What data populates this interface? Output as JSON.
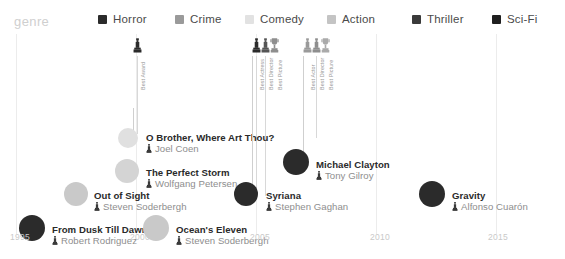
{
  "legend": {
    "title": "genre",
    "items": [
      {
        "label": "Horror",
        "color": "#2b2b2b",
        "x": 98
      },
      {
        "label": "Crime",
        "color": "#9a9a9a",
        "x": 175
      },
      {
        "label": "Comedy",
        "color": "#e2e2e2",
        "x": 245
      },
      {
        "label": "Action",
        "color": "#c4c4c4",
        "x": 327
      },
      {
        "label": "Thriller",
        "color": "#3a3a3a",
        "x": 412
      },
      {
        "label": "Sci-Fi",
        "color": "#1f1f1f",
        "x": 492
      }
    ]
  },
  "axis": {
    "ticks": [
      {
        "label": "1995",
        "x": 10
      },
      {
        "label": "2000",
        "x": 130
      },
      {
        "label": "2005",
        "x": 250
      },
      {
        "label": "2010",
        "x": 370
      },
      {
        "label": "2015",
        "x": 488
      }
    ],
    "gridlines_x": [
      16,
      136,
      256,
      376,
      496
    ]
  },
  "awards": [
    {
      "name": "award-marker-1",
      "label": "Best Award",
      "icon": "oscar-statuette-icon",
      "color": "#2b2b2b",
      "x": 133,
      "icon_y": 4,
      "text_y": 56,
      "stem_y": 22,
      "stem_h": 78
    },
    {
      "name": "award-marker-2",
      "label": "Best Actress",
      "icon": "oscar-statuette-icon",
      "color": "#2b2b2b",
      "x": 252,
      "icon_y": 4,
      "text_y": 56,
      "stem_y": 22,
      "stem_h": 140
    },
    {
      "name": "award-marker-3",
      "label": "Best Director",
      "icon": "oscar-statuette-icon",
      "color": "#555555",
      "x": 261,
      "icon_y": 4,
      "text_y": 56,
      "stem_y": 22,
      "stem_h": 140
    },
    {
      "name": "award-marker-4",
      "label": "Best Picture",
      "icon": "oscar-trophy-icon",
      "color": "#8e8e8e",
      "x": 270,
      "icon_y": 4,
      "text_y": 56,
      "stem_y": 22,
      "stem_h": 0
    },
    {
      "name": "award-marker-5",
      "label": "Best Actor",
      "icon": "oscar-statuette-icon",
      "color": "#9a9a9a",
      "x": 303,
      "icon_y": 4,
      "text_y": 56,
      "stem_y": 22,
      "stem_h": 0
    },
    {
      "name": "award-marker-6",
      "label": "Best Director",
      "icon": "oscar-statuette-icon",
      "color": "#8e8e8e",
      "x": 312,
      "icon_y": 4,
      "text_y": 56,
      "stem_y": 22,
      "stem_h": 82
    },
    {
      "name": "award-marker-7",
      "label": "Best Picture",
      "icon": "oscar-trophy-icon",
      "color": "#aaaaaa",
      "x": 321,
      "icon_y": 4,
      "text_y": 56,
      "stem_y": 22,
      "stem_h": 0
    }
  ],
  "films": [
    {
      "title": "O Brother, Where Art Thou?",
      "director": "Joel Coen",
      "genre": "Comedy",
      "color": "#e0e0e0",
      "dot_x": 128,
      "dot_y": 104,
      "dot_r": 10,
      "text_x": 146,
      "text_y": 98,
      "stem_x": 133,
      "stem_y": 74,
      "stem_h": 32
    },
    {
      "title": "The Perfect Storm",
      "director": "Wolfgang Petersen",
      "genre": "Action",
      "color": "#d4d4d4",
      "dot_x": 127,
      "dot_y": 137,
      "dot_r": 12,
      "text_x": 146,
      "text_y": 133,
      "stem_x": 0,
      "stem_y": 0,
      "stem_h": 0
    },
    {
      "title": "Michael Clayton",
      "director": "Tony Gilroy",
      "genre": "Thriller",
      "color": "#2b2b2b",
      "dot_x": 296,
      "dot_y": 128,
      "dot_r": 13,
      "text_x": 316,
      "text_y": 125,
      "stem_x": 303,
      "stem_y": 22,
      "stem_h": 106
    },
    {
      "title": "Out of Sight",
      "director": "Steven Soderbergh",
      "genre": "Crime",
      "color": "#c9c9c9",
      "dot_x": 76,
      "dot_y": 160,
      "dot_r": 12,
      "text_x": 94,
      "text_y": 156,
      "stem_x": 0,
      "stem_y": 0,
      "stem_h": 0
    },
    {
      "title": "Syriana",
      "director": "Stephen Gaghan",
      "genre": "Thriller",
      "color": "#2b2b2b",
      "dot_x": 246,
      "dot_y": 160,
      "dot_r": 12,
      "text_x": 266,
      "text_y": 156,
      "stem_x": 252,
      "stem_y": 22,
      "stem_h": 138
    },
    {
      "title": "Gravity",
      "director": "Alfonso Cuarón",
      "genre": "Sci-Fi",
      "color": "#2b2b2b",
      "dot_x": 432,
      "dot_y": 160,
      "dot_r": 13,
      "text_x": 452,
      "text_y": 156,
      "stem_x": 0,
      "stem_y": 0,
      "stem_h": 0
    },
    {
      "title": "From Dusk Till Dawn",
      "director": "Robert Rodriguez",
      "genre": "Horror",
      "color": "#2b2b2b",
      "dot_x": 32,
      "dot_y": 194,
      "dot_r": 13,
      "text_x": 52,
      "text_y": 190,
      "stem_x": 0,
      "stem_y": 0,
      "stem_h": 0
    },
    {
      "title": "Ocean's Eleven",
      "director": "Steven Soderbergh",
      "genre": "Crime",
      "color": "#c9c9c9",
      "dot_x": 156,
      "dot_y": 194,
      "dot_r": 13,
      "text_x": 176,
      "text_y": 190,
      "stem_x": 0,
      "stem_y": 0,
      "stem_h": 0
    }
  ]
}
